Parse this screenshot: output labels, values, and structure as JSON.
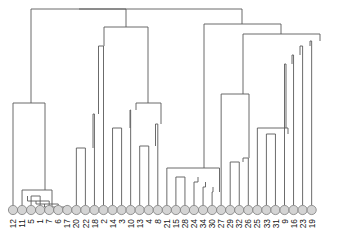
{
  "figure": {
    "kind": "dendrogram",
    "title": "",
    "axis_visible": false
  },
  "chart_data": {
    "type": "line",
    "subtype": "dendrogram",
    "title": "",
    "xlabel": "",
    "ylabel": "",
    "orientation": "vertical-top-down",
    "grid": false,
    "legend": null,
    "n_leaves": 34,
    "leaf_order": [
      "12",
      "11",
      "5",
      "1",
      "7",
      "6",
      "17",
      "20",
      "22",
      "18",
      "2",
      "14",
      "3",
      "10",
      "13",
      "4",
      "8",
      "21",
      "15",
      "28",
      "24",
      "34",
      "30",
      "27",
      "29",
      "32",
      "26",
      "25",
      "33",
      "31",
      "9",
      "16",
      "23",
      "19"
    ],
    "categories": [
      "12",
      "11",
      "5",
      "1",
      "7",
      "6",
      "17",
      "20",
      "22",
      "18",
      "2",
      "14",
      "3",
      "10",
      "13",
      "4",
      "8",
      "21",
      "15",
      "28",
      "24",
      "34",
      "30",
      "27",
      "29",
      "32",
      "26",
      "25",
      "33",
      "31",
      "9",
      "16",
      "23",
      "19"
    ],
    "values": [
      0,
      0,
      0,
      0,
      0,
      0,
      0,
      0,
      0,
      0,
      0,
      0,
      0,
      0,
      0,
      0,
      0,
      0,
      0,
      0,
      0,
      0,
      0,
      0,
      0,
      0,
      0,
      0,
      0,
      0,
      0,
      0,
      0,
      0
    ],
    "axis_range_y": [
      0,
      210
    ],
    "note": "Heights given in pixel-space from baseline y=210 (leaves) upward; smaller y = higher merge.",
    "merges": [
      {
        "id": "m1",
        "children": [
          "5",
          "1"
        ],
        "y": 196,
        "x": 27.5
      },
      {
        "id": "m2",
        "children": [
          "m1",
          "7"
        ],
        "y": 201,
        "x": 36.0
      },
      {
        "id": "m3",
        "children": [
          "m2",
          "6"
        ],
        "y": 204,
        "x": 44.5
      },
      {
        "id": "m4",
        "children": [
          "m3",
          "17"
        ],
        "y": 207,
        "x": 52.0
      },
      {
        "id": "m5",
        "children": [
          "11",
          "m4"
        ],
        "y": 190,
        "x": 45.0
      },
      {
        "id": "m6",
        "children": [
          "12",
          "m5"
        ],
        "y": 103,
        "x": 31.0
      },
      {
        "id": "m7",
        "children": [
          "20",
          "22"
        ],
        "y": 148,
        "x": 93.0
      },
      {
        "id": "m8",
        "children": [
          "m7",
          "18"
        ],
        "y": 114,
        "x": 98.5
      },
      {
        "id": "m9",
        "children": [
          "m8",
          "2"
        ],
        "y": 46,
        "x": 104.0
      },
      {
        "id": "m10",
        "children": [
          "14",
          "3"
        ],
        "y": 128,
        "x": 130.0
      },
      {
        "id": "m11",
        "children": [
          "m10",
          "10"
        ],
        "y": 110,
        "x": 136.0
      },
      {
        "id": "m12",
        "children": [
          "13",
          "4"
        ],
        "y": 146,
        "x": 155.5
      },
      {
        "id": "m13",
        "children": [
          "m12",
          "8"
        ],
        "y": 124,
        "x": 161.0
      },
      {
        "id": "m14",
        "children": [
          "m11",
          "m13"
        ],
        "y": 103,
        "x": 148.0
      },
      {
        "id": "m15",
        "children": [
          "m9",
          "m14"
        ],
        "y": 27,
        "x": 126.0
      },
      {
        "id": "m16",
        "children": [
          "m6",
          "m15"
        ],
        "y": 9,
        "x": 79.0
      },
      {
        "id": "m17",
        "children": [
          "15",
          "28"
        ],
        "y": 177,
        "x": 198.0
      },
      {
        "id": "m18",
        "children": [
          "m17",
          "24"
        ],
        "y": 182,
        "x": 205.5
      },
      {
        "id": "m19",
        "children": [
          "m18",
          "34"
        ],
        "y": 187,
        "x": 213.0
      },
      {
        "id": "m20",
        "children": [
          "m19",
          "30"
        ],
        "y": 192,
        "x": 219.5
      },
      {
        "id": "m21",
        "children": [
          "21",
          "m20"
        ],
        "y": 168,
        "x": 204.0
      },
      {
        "id": "m22",
        "children": [
          "29",
          "32"
        ],
        "y": 162,
        "x": 243.0
      },
      {
        "id": "m23",
        "children": [
          "m22",
          "26"
        ],
        "y": 158,
        "x": 249.0
      },
      {
        "id": "m24",
        "children": [
          "27",
          "m23"
        ],
        "y": 94,
        "x": 243.0
      },
      {
        "id": "m25",
        "children": [
          "33",
          "31"
        ],
        "y": 134,
        "x": 288.0
      },
      {
        "id": "m26",
        "children": [
          "25",
          "m25"
        ],
        "y": 128,
        "x": 286.0
      },
      {
        "id": "m27",
        "children": [
          "m26",
          "9"
        ],
        "y": 64,
        "x": 292.0
      },
      {
        "id": "m28",
        "children": [
          "m27",
          "16"
        ],
        "y": 55,
        "x": 300.0
      },
      {
        "id": "m29",
        "children": [
          "m28",
          "23"
        ],
        "y": 46,
        "x": 310.0
      },
      {
        "id": "m30",
        "children": [
          "m29",
          "19"
        ],
        "y": 41,
        "x": 320.0
      },
      {
        "id": "m31",
        "children": [
          "m24",
          "m30"
        ],
        "y": 34,
        "x": 281.0
      },
      {
        "id": "m32",
        "children": [
          "m21",
          "m31"
        ],
        "y": 24,
        "x": 242.0
      },
      {
        "id": "m33",
        "children": [
          "m16",
          "m32"
        ],
        "y": 9,
        "x": 160.0
      }
    ]
  },
  "layout": {
    "leaf_baseline_y": 210,
    "leaf_node_radius": 4.6,
    "leaf_first_x": 13.0,
    "leaf_spacing": 9.05,
    "stroke_color": "#5a5a5a",
    "leaf_fill_color": "#d4d4d4",
    "leaf_stroke_color": "#7d7d7d",
    "background_color": "#ffffff",
    "label_color": "#151515"
  }
}
